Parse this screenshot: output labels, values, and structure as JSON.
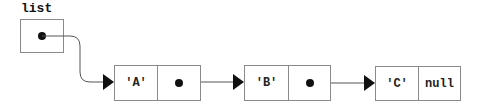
{
  "diagram": {
    "type": "linked-list",
    "head": {
      "label": "list"
    },
    "nodes": [
      {
        "value": "'A'",
        "next": "pointer"
      },
      {
        "value": "'B'",
        "next": "pointer"
      },
      {
        "value": "'C'",
        "next": "null"
      }
    ],
    "colors": {
      "border": "#8a8a8a",
      "arrow": "#111111",
      "text": "#222222"
    }
  }
}
